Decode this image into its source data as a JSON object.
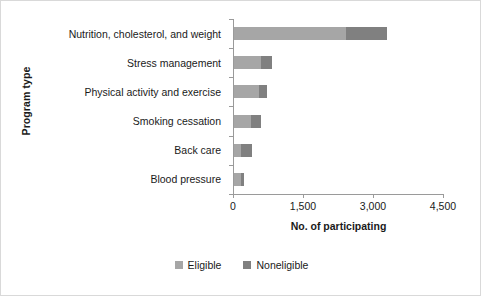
{
  "chart_data": {
    "type": "bar",
    "orientation": "horizontal",
    "stacked": true,
    "title": "",
    "xlabel": "No. of participating",
    "ylabel": "Program type",
    "categories": [
      "Nutrition, cholesterol, and weight",
      "Stress management",
      "Physical activity and exercise",
      "Smoking cessation",
      "Back care",
      "Blood pressure"
    ],
    "series": [
      {
        "name": "Eligible",
        "color": "#a6a6a6",
        "values": [
          2400,
          580,
          530,
          370,
          160,
          150
        ]
      },
      {
        "name": "Noneligible",
        "color": "#808080",
        "values": [
          880,
          235,
          180,
          215,
          230,
          60
        ]
      }
    ],
    "totals": [
      3280,
      815,
      710,
      585,
      390,
      210
    ],
    "xlim": [
      0,
      4500
    ],
    "xticks": [
      0,
      1500,
      3000,
      4500
    ],
    "xtick_labels": [
      "0",
      "1,500",
      "3,000",
      "4,500"
    ],
    "grid": false,
    "legend_position": "bottom"
  },
  "legend": {
    "items": [
      {
        "label": "Eligible",
        "color": "#a6a6a6"
      },
      {
        "label": "Noneligible",
        "color": "#808080"
      }
    ]
  },
  "colors": {
    "eligible": "#a6a6a6",
    "noneligible": "#808080",
    "axis": "#9a9a9a",
    "text": "#1a1a1a",
    "background": "#ffffff",
    "border": "#d9d9d9"
  }
}
